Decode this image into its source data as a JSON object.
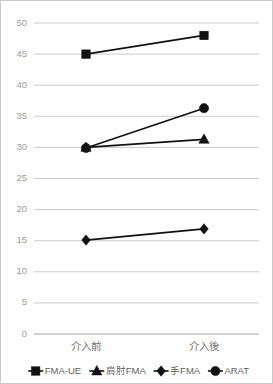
{
  "chart_data": {
    "type": "line",
    "title": "",
    "xlabel": "",
    "ylabel": "",
    "categories": [
      "介入前",
      "介入後"
    ],
    "ylim": [
      0,
      50
    ],
    "ytick_step": 5,
    "yticks": [
      "50",
      "45",
      "40",
      "35",
      "30",
      "25",
      "20",
      "15",
      "10",
      "5",
      "0"
    ],
    "grid": true,
    "legend_position": "bottom",
    "series": [
      {
        "name": "FMA-UE",
        "marker": "square",
        "values": [
          45.0,
          48.0
        ]
      },
      {
        "name": "肩肘FMA",
        "marker": "triangle",
        "values": [
          30.0,
          31.3
        ]
      },
      {
        "name": "手FMA",
        "marker": "diamond",
        "values": [
          15.1,
          16.9
        ]
      },
      {
        "name": "ARAT",
        "marker": "circle",
        "values": [
          29.9,
          36.3
        ]
      }
    ],
    "colors": {
      "line": "#111111",
      "marker": "#111111",
      "grid": "#bdbdbd",
      "axis": "#9a9a9a",
      "tick_text": "#9b9b9b",
      "category_text": "#6f6f6f",
      "legend_text": "#5f5f5f",
      "frame": "#c9c9c9",
      "background": "#ffffff"
    }
  },
  "legend": {
    "items": [
      {
        "label": "FMA-UE",
        "marker": "square-marker-icon"
      },
      {
        "label": "肩肘FMA",
        "marker": "triangle-marker-icon"
      },
      {
        "label": "手FMA",
        "marker": "diamond-marker-icon"
      },
      {
        "label": "ARAT",
        "marker": "circle-marker-icon"
      }
    ]
  }
}
